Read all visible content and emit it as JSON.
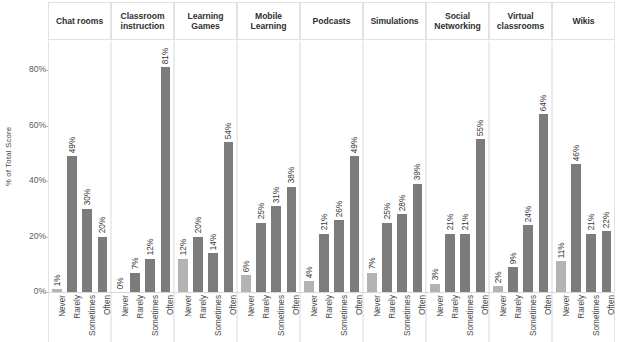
{
  "chart_data": {
    "type": "bar",
    "title": "",
    "subtitle": "",
    "xlabel": "",
    "ylabel": "% of Total Score",
    "ylim": [
      0,
      90
    ],
    "yticks": [
      "0%",
      "20%",
      "40%",
      "60%",
      "80%"
    ],
    "ytick_values": [
      0,
      20,
      40,
      60,
      80
    ],
    "grid": false,
    "legend_position": "none",
    "categories": [
      "Never",
      "Rarely",
      "Sometimes",
      "Often"
    ],
    "facet_layout": "horizontal-strip",
    "facets": [
      {
        "label": "Chat rooms",
        "values": [
          1,
          49,
          30,
          20
        ],
        "value_labels": [
          "1%",
          "49%",
          "30%",
          "20%"
        ]
      },
      {
        "label": "Classroom instruction",
        "values": [
          0,
          7,
          12,
          81
        ],
        "value_labels": [
          "0%",
          "7%",
          "12%",
          "81%"
        ]
      },
      {
        "label": "Learning Games",
        "values": [
          12,
          20,
          14,
          54
        ],
        "value_labels": [
          "12%",
          "20%",
          "14%",
          "54%"
        ]
      },
      {
        "label": "Mobile Learning",
        "values": [
          6,
          25,
          31,
          38
        ],
        "value_labels": [
          "6%",
          "25%",
          "31%",
          "38%"
        ]
      },
      {
        "label": "Podcasts",
        "values": [
          4,
          21,
          26,
          49
        ],
        "value_labels": [
          "4%",
          "21%",
          "26%",
          "49%"
        ]
      },
      {
        "label": "Simulations",
        "values": [
          7,
          25,
          28,
          39
        ],
        "value_labels": [
          "7%",
          "25%",
          "28%",
          "39%"
        ]
      },
      {
        "label": "Social Networking",
        "values": [
          3,
          21,
          21,
          55
        ],
        "value_labels": [
          "3%",
          "21%",
          "21%",
          "55%"
        ]
      },
      {
        "label": "Virtual classrooms",
        "values": [
          2,
          9,
          24,
          64
        ],
        "value_labels": [
          "2%",
          "9%",
          "24%",
          "64%"
        ]
      },
      {
        "label": "Wikis",
        "values": [
          11,
          46,
          21,
          22
        ],
        "value_labels": [
          "11%",
          "46%",
          "21%",
          "22%"
        ]
      }
    ],
    "colors": {
      "bar_never": "#b3b3b3",
      "bar_other": "#7c7c7c",
      "panel_border": "#e2e2e2",
      "text": "#3d3d3d"
    }
  }
}
